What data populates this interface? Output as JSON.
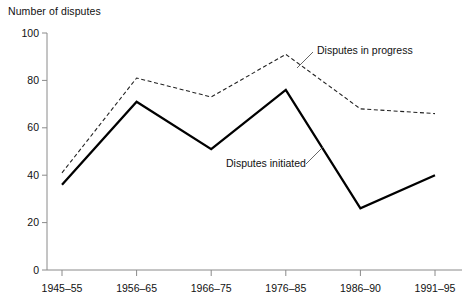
{
  "chart_data": {
    "type": "line",
    "title": "",
    "ylabel": "Number of disputes",
    "xlabel": "",
    "categories": [
      "1945–55",
      "1956–65",
      "1966–75",
      "1976–85",
      "1986–90",
      "1991–95"
    ],
    "series": [
      {
        "name": "Disputes in progress",
        "style": "dashed",
        "color": "#222222",
        "values": [
          41,
          81,
          73,
          91,
          68,
          66
        ]
      },
      {
        "name": "Disputes initiated",
        "style": "solid",
        "color": "#000000",
        "values": [
          36,
          71,
          51,
          76,
          26,
          40
        ]
      }
    ],
    "ylim": [
      0,
      100
    ],
    "yticks": [
      0,
      20,
      40,
      60,
      80,
      100
    ],
    "ytick_labels": [
      "0",
      "20",
      "40",
      "60",
      "80",
      "100"
    ],
    "grid": false,
    "legend": "inline-annotations",
    "annotations": [
      {
        "text": "Disputes in progress",
        "anchor_series": "Disputes in progress"
      },
      {
        "text": "Disputes initiated",
        "anchor_series": "Disputes initiated"
      }
    ]
  },
  "labels": {
    "y_axis_title": "Number of disputes",
    "annotation_in_progress": "Disputes in progress",
    "annotation_initiated": "Disputes initiated"
  }
}
